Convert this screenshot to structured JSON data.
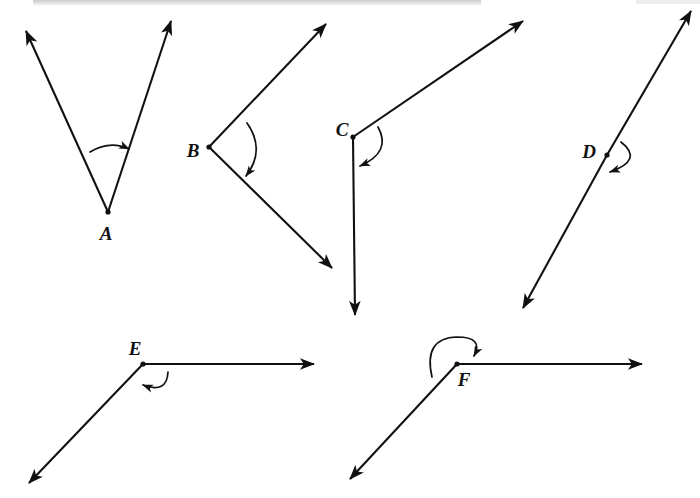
{
  "diagram": {
    "type": "geometry-angle-diagram",
    "background_color": "#ffffff",
    "stroke_color": "#111111",
    "canvas": {
      "width": 700,
      "height": 498
    },
    "angles": [
      {
        "id": "A",
        "label": "A",
        "label_pos": {
          "x": 106,
          "y": 235
        },
        "vertex": {
          "x": 108,
          "y": 212
        },
        "classification": "acute",
        "measure_deg": 42,
        "rays": [
          {
            "name": "ray-a-left",
            "to": {
              "x": 26,
              "y": 31
            },
            "arrow": true
          },
          {
            "name": "ray-a-right",
            "to": {
              "x": 171,
              "y": 21
            },
            "arrow": true
          }
        ],
        "arc": {
          "name": "arc-a",
          "d": "M 90 152 Q 110 140 129 149",
          "arrow_tip": {
            "x": 131,
            "y": 150
          },
          "arrow_angle_deg": 24,
          "direction": "counterclockwise-to-clockwise"
        }
      },
      {
        "id": "B",
        "label": "B",
        "label_pos": {
          "x": 193,
          "y": 152
        },
        "vertex": {
          "x": 209,
          "y": 147
        },
        "classification": "acute",
        "measure_deg": 64,
        "rays": [
          {
            "name": "ray-b-upper",
            "to": {
              "x": 326,
              "y": 24
            },
            "arrow": true
          },
          {
            "name": "ray-b-lower",
            "to": {
              "x": 332,
              "y": 268
            },
            "arrow": true
          }
        ],
        "arc": {
          "name": "arc-b",
          "d": "M 247 123 Q 266 150 246 176",
          "arrow_tip": {
            "x": 244,
            "y": 179
          },
          "arrow_angle_deg": 110,
          "direction": "clockwise"
        }
      },
      {
        "id": "C",
        "label": "C",
        "label_pos": {
          "x": 342,
          "y": 131
        },
        "vertex": {
          "x": 353,
          "y": 137
        },
        "classification": "obtuse",
        "measure_deg": 123,
        "rays": [
          {
            "name": "ray-c-upper-right",
            "to": {
              "x": 523,
              "y": 21
            },
            "arrow": true
          },
          {
            "name": "ray-c-down",
            "to": {
              "x": 355,
              "y": 315
            },
            "arrow": true
          }
        ],
        "arc": {
          "name": "arc-c",
          "d": "M 378 127 Q 392 152 360 166",
          "arrow_tip": {
            "x": 356,
            "y": 167
          },
          "arrow_angle_deg": 190,
          "direction": "clockwise"
        }
      },
      {
        "id": "D",
        "label": "D",
        "label_pos": {
          "x": 589,
          "y": 153
        },
        "vertex": {
          "x": 607,
          "y": 155
        },
        "classification": "straight",
        "measure_deg": 180,
        "rays": [
          {
            "name": "ray-d-upper-right",
            "to": {
              "x": 691,
              "y": 11
            },
            "arrow": true
          },
          {
            "name": "ray-d-lower-left",
            "to": {
              "x": 523,
              "y": 308
            },
            "arrow": true
          }
        ],
        "arc": {
          "name": "arc-d",
          "d": "M 621 142 Q 644 160 610 172",
          "arrow_tip": {
            "x": 605,
            "y": 173
          },
          "arrow_angle_deg": 196,
          "direction": "clockwise"
        }
      },
      {
        "id": "E",
        "label": "E",
        "label_pos": {
          "x": 135,
          "y": 350
        },
        "vertex": {
          "x": 143,
          "y": 364
        },
        "classification": "obtuse",
        "measure_deg": 157,
        "rays": [
          {
            "name": "ray-e-right",
            "to": {
              "x": 314,
              "y": 364
            },
            "arrow": true
          },
          {
            "name": "ray-e-lower-left",
            "to": {
              "x": 29,
              "y": 483
            },
            "arrow": true
          }
        ],
        "arc": {
          "name": "arc-e",
          "d": "M 168 372 Q 165 394 143 385",
          "arrow_tip": {
            "x": 139,
            "y": 383
          },
          "arrow_angle_deg": 205,
          "direction": "clockwise"
        }
      },
      {
        "id": "F",
        "label": "F",
        "label_pos": {
          "x": 464,
          "y": 381
        },
        "vertex": {
          "x": 457,
          "y": 364
        },
        "classification": "reflex",
        "measure_deg": 215,
        "rays": [
          {
            "name": "ray-f-right",
            "to": {
              "x": 642,
              "y": 364
            },
            "arrow": true
          },
          {
            "name": "ray-f-lower-left",
            "to": {
              "x": 350,
              "y": 479
            },
            "arrow": true
          }
        ],
        "arc": {
          "name": "arc-f",
          "d": "M 432 377 Q 425 339 457 338 Q 482 338 474 356",
          "arrow_tip": {
            "x": 473,
            "y": 359
          },
          "arrow_angle_deg": 110,
          "direction": "counterclockwise"
        }
      }
    ],
    "artifacts": {
      "top_band_label": "scan-shadow-band",
      "noise_label": "scan-noise"
    }
  }
}
